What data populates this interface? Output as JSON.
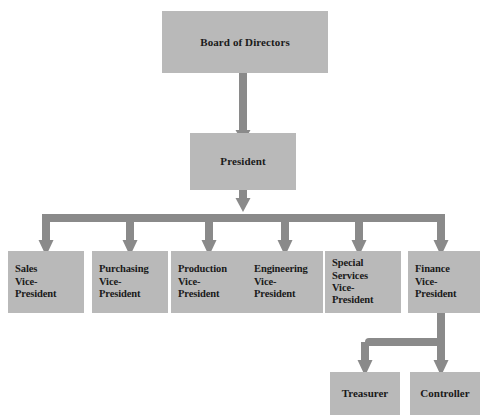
{
  "diagram": {
    "type": "organization-chart",
    "colors": {
      "box_fill": "#b9b9b9",
      "connector": "#8a8a8a",
      "text": "#1a1a1a",
      "background": "#ffffff"
    },
    "nodes": {
      "board": {
        "label": "Board of Directors",
        "level": 1,
        "x": 162,
        "y": 11,
        "width": 166,
        "height": 62
      },
      "president": {
        "label": "President",
        "level": 2,
        "x": 190,
        "y": 133,
        "width": 106,
        "height": 57
      },
      "vice_presidents": [
        {
          "label": "Sales\nVice-\nPresident",
          "name": "sales",
          "x": 8,
          "y": 251,
          "width": 76,
          "height": 62
        },
        {
          "label": "Purchasing\nVice-\nPresident",
          "name": "purchasing",
          "x": 92,
          "y": 251,
          "width": 76,
          "height": 62
        },
        {
          "label": "Production\nVice-\nPresident",
          "name": "production",
          "x": 171,
          "y": 251,
          "width": 76,
          "height": 62
        },
        {
          "label": "Engineering\nVice-\nPresident",
          "name": "engineering",
          "x": 247,
          "y": 251,
          "width": 76,
          "height": 62
        },
        {
          "label": "Special\nServices\nVice-\nPresident",
          "name": "special-services",
          "x": 325,
          "y": 251,
          "width": 76,
          "height": 62
        },
        {
          "label": "Finance\nVice-\nPresident",
          "name": "finance",
          "x": 408,
          "y": 251,
          "width": 72,
          "height": 62
        }
      ],
      "finance_reports": [
        {
          "label": "Treasurer",
          "name": "treasurer",
          "x": 330,
          "y": 372,
          "width": 70,
          "height": 43
        },
        {
          "label": "Controller",
          "name": "controller",
          "x": 410,
          "y": 372,
          "width": 70,
          "height": 43
        }
      ]
    },
    "relationships": [
      {
        "from": "Board of Directors",
        "to": "President"
      },
      {
        "from": "President",
        "to": "Sales Vice-President"
      },
      {
        "from": "President",
        "to": "Purchasing Vice-President"
      },
      {
        "from": "President",
        "to": "Production Vice-President"
      },
      {
        "from": "President",
        "to": "Engineering Vice-President"
      },
      {
        "from": "President",
        "to": "Special Services Vice-President"
      },
      {
        "from": "President",
        "to": "Finance Vice-President"
      },
      {
        "from": "Finance Vice-President",
        "to": "Treasurer"
      },
      {
        "from": "Finance Vice-President",
        "to": "Controller"
      }
    ]
  }
}
